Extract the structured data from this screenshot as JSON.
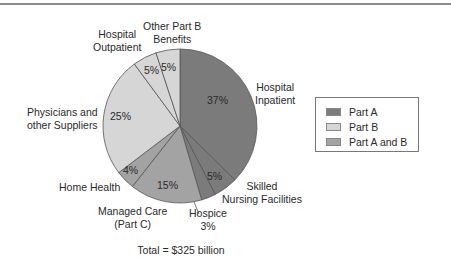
{
  "chart_data": {
    "type": "pie",
    "title": "",
    "footer": "Total = $325 billion",
    "total": "$325 billion",
    "start_angle_deg": 0,
    "direction": "clockwise",
    "slices": [
      {
        "label": "Hospital Inpatient",
        "value": 37,
        "pct_label": "37%",
        "group": "Part A"
      },
      {
        "label": "Skilled Nursing Facilities",
        "value": 5,
        "pct_label": "5%",
        "group": "Part A"
      },
      {
        "label": "Hospice",
        "value": 3,
        "pct_label": "3%",
        "group": "Part A"
      },
      {
        "label": "Managed Care (Part C)",
        "value": 15,
        "pct_label": "15%",
        "group": "Part A and B"
      },
      {
        "label": "Home Health",
        "value": 4,
        "pct_label": "4%",
        "group": "Part A and B"
      },
      {
        "label": "Physicians and other Suppliers",
        "value": 25,
        "pct_label": "25%",
        "group": "Part B"
      },
      {
        "label": "Hospital Outpatient",
        "value": 5,
        "pct_label": "5%",
        "group": "Part B"
      },
      {
        "label": "Other Part B Benefits",
        "value": 5,
        "pct_label": "5%",
        "group": "Part B"
      }
    ],
    "legend": {
      "position": "right",
      "entries": [
        {
          "label": "Part A",
          "color": "#7b7b7b"
        },
        {
          "label": "Part B",
          "color": "#d6d6d6"
        },
        {
          "label": "Part A and B",
          "color": "#a3a3a3"
        }
      ]
    },
    "colors": {
      "Part A": "#7b7b7b",
      "Part B": "#d6d6d6",
      "Part A and B": "#a3a3a3",
      "edge": "#555555"
    }
  },
  "labels": {
    "hospital_inpatient": [
      "Hospital",
      "Inpatient"
    ],
    "snf": [
      "Skilled",
      "Nursing Facilities"
    ],
    "hospice": [
      "Hospice",
      "3%"
    ],
    "managed_care": [
      "Managed Care",
      "(Part C)"
    ],
    "home_health": "Home Health",
    "physicians": [
      "Physicians and",
      "other Suppliers"
    ],
    "hospital_outpatient": [
      "Hospital",
      "Outpatient"
    ],
    "other_part_b": [
      "Other Part B",
      "Benefits"
    ]
  },
  "pct_labels": {
    "hospital_inpatient": "37%",
    "snf": "5%",
    "managed_care": "15%",
    "home_health": "4%",
    "physicians": "25%",
    "hospital_outpatient": "5%",
    "other_part_b": "5%"
  },
  "legend": {
    "items": [
      {
        "label": "Part A",
        "color": "#7b7b7b"
      },
      {
        "label": "Part B",
        "color": "#d6d6d6"
      },
      {
        "label": "Part A and B",
        "color": "#a3a3a3"
      }
    ]
  },
  "footer": {
    "total": "Total = $325 billion"
  }
}
